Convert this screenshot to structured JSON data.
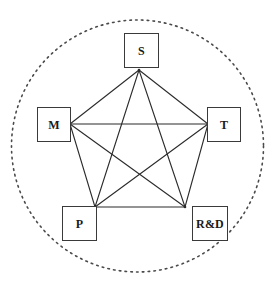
{
  "diagram": {
    "canvas": {
      "width": 278,
      "height": 289,
      "background": "#ffffff"
    },
    "boundary": {
      "name": "dotted-circle",
      "shape": "circle",
      "style": "dotted",
      "color": "#4a4a4a",
      "center_x": 137.5,
      "center_y": 146,
      "radius": 126
    },
    "graph": {
      "type": "complete-graph-K5",
      "edge_color": "#2b2b2b",
      "edge_width": 1.1,
      "nodes": [
        {
          "id": "S",
          "label": "S",
          "vertex_x": 139,
          "vertex_y": 70,
          "box_x": 124,
          "box_y": 33,
          "box_w": 35,
          "box_h": 35,
          "font_size": 12
        },
        {
          "id": "M",
          "label": "M",
          "vertex_x": 70,
          "vertex_y": 124,
          "box_x": 37,
          "box_y": 107,
          "box_w": 34,
          "box_h": 35,
          "font_size": 12
        },
        {
          "id": "T",
          "label": "T",
          "vertex_x": 208,
          "vertex_y": 124,
          "box_x": 207,
          "box_y": 107,
          "box_w": 34,
          "box_h": 35,
          "font_size": 12
        },
        {
          "id": "P",
          "label": "P",
          "vertex_x": 95,
          "vertex_y": 207,
          "box_x": 62,
          "box_y": 206,
          "box_w": 35,
          "box_h": 35,
          "font_size": 12
        },
        {
          "id": "RD",
          "label": "R&D",
          "vertex_x": 185,
          "vertex_y": 207,
          "box_x": 192,
          "box_y": 206,
          "box_w": 36,
          "box_h": 35,
          "font_size": 12
        }
      ],
      "edges": [
        {
          "from": "S",
          "to": "M",
          "kind": "perimeter"
        },
        {
          "from": "S",
          "to": "T",
          "kind": "perimeter"
        },
        {
          "from": "M",
          "to": "P",
          "kind": "perimeter"
        },
        {
          "from": "T",
          "to": "RD",
          "kind": "perimeter"
        },
        {
          "from": "P",
          "to": "RD",
          "kind": "perimeter"
        },
        {
          "from": "S",
          "to": "P",
          "kind": "diagonal"
        },
        {
          "from": "S",
          "to": "RD",
          "kind": "diagonal"
        },
        {
          "from": "M",
          "to": "T",
          "kind": "diagonal"
        },
        {
          "from": "M",
          "to": "RD",
          "kind": "diagonal"
        },
        {
          "from": "T",
          "to": "P",
          "kind": "diagonal"
        }
      ]
    }
  }
}
